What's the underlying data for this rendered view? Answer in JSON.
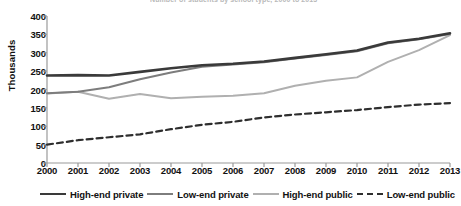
{
  "figure": {
    "clipped_title": "Number of students by school type, 2000 to 2013",
    "ylabel": "Thousands"
  },
  "chart_data": {
    "type": "line",
    "title": "",
    "xlabel": "",
    "ylabel": "Thousands",
    "ylim": [
      0,
      400
    ],
    "ytick_step": 50,
    "yticks": [
      400,
      350,
      300,
      250,
      200,
      150,
      100,
      50,
      0
    ],
    "grid": false,
    "legend_position": "bottom",
    "categories": [
      "2000",
      "2001",
      "2002",
      "2003",
      "2004",
      "2005",
      "2006",
      "2007",
      "2008",
      "2009",
      "2010",
      "2011",
      "2012",
      "2013"
    ],
    "series": [
      {
        "name": "High-end private",
        "color": "#3a3a3a",
        "style": "solid",
        "width": 2.6,
        "values": [
          238,
          239,
          238,
          248,
          258,
          266,
          270,
          276,
          286,
          296,
          306,
          328,
          338,
          353
        ]
      },
      {
        "name": "Low-end private",
        "color": "#7d7d7d",
        "style": "solid",
        "width": 2.0,
        "values": [
          190,
          194,
          206,
          228,
          246,
          262,
          268,
          274,
          284,
          294,
          304,
          326,
          337,
          351
        ]
      },
      {
        "name": "High-end public",
        "color": "#b0b0b0",
        "style": "solid",
        "width": 2.0,
        "values": [
          189,
          194,
          175,
          188,
          176,
          180,
          183,
          190,
          210,
          224,
          233,
          275,
          307,
          348
        ]
      },
      {
        "name": "Low-end public",
        "color": "#2e2e2e",
        "style": "dashed",
        "width": 2.2,
        "values": [
          50,
          62,
          70,
          78,
          92,
          104,
          112,
          124,
          132,
          138,
          144,
          152,
          159,
          163
        ]
      }
    ]
  },
  "legend": {
    "items": [
      {
        "label": "High-end private"
      },
      {
        "label": "Low-end private"
      },
      {
        "label": "High-end public"
      },
      {
        "label": "Low-end public"
      }
    ]
  }
}
